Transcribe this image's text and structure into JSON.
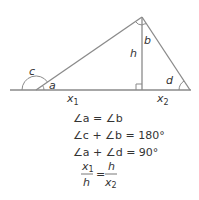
{
  "diagram": {
    "labels": {
      "c": "c",
      "a": "a",
      "h": "h",
      "b": "b",
      "d": "d",
      "x1": "x",
      "x1_sub": "1",
      "x2": "x",
      "x2_sub": "2"
    },
    "equations": {
      "eq1": "∠a = ∠b",
      "eq2": "∠c + ∠b = 180°",
      "eq3": "∠a + ∠d = 90°",
      "ratio_left_num": "x",
      "ratio_left_num_sub": "1",
      "ratio_left_den": "h",
      "ratio_equals": "=",
      "ratio_right_num": "h",
      "ratio_right_den": "x",
      "ratio_right_den_sub": "2"
    },
    "colors": {
      "line": "#8a8a8a",
      "text": "#333333"
    }
  }
}
